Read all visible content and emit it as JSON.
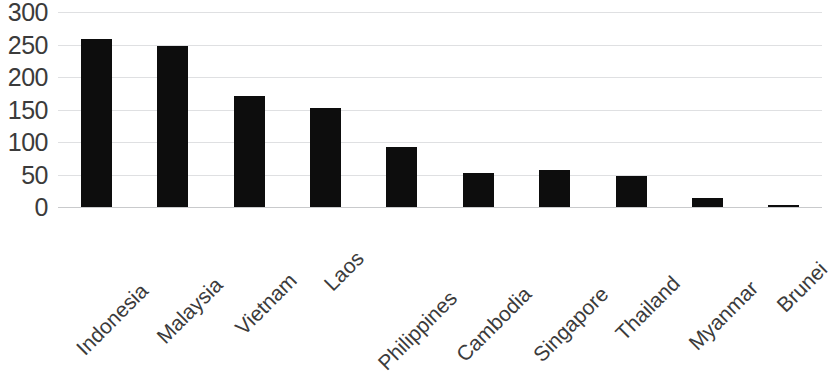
{
  "chart_data": {
    "type": "bar",
    "title": "",
    "subtitle": "",
    "xlabel": "",
    "ylabel": "",
    "categories": [
      "Indonesia",
      "Malaysia",
      "Vietnam",
      "Laos",
      "Philippines",
      "Cambodia",
      "Singapore",
      "Thailand",
      "Myanmar",
      "Brunei"
    ],
    "values": [
      258,
      248,
      171,
      152,
      93,
      52,
      57,
      47,
      14,
      3
    ],
    "ylim": [
      0,
      300
    ],
    "ytick_values": [
      0,
      50,
      100,
      150,
      200,
      250,
      300
    ],
    "ytick_labels": [
      "0",
      "50",
      "100",
      "150",
      "200",
      "250",
      "300"
    ],
    "grid": true,
    "grid_axis": "y",
    "legend": false,
    "legend_position": "none",
    "bar_color": "#0d0d0d",
    "gridline_color": "#dfe0e2",
    "axis_text_color": "#3b3b3b",
    "background_color": "#ffffff",
    "xtick_label_rotation": -45
  }
}
